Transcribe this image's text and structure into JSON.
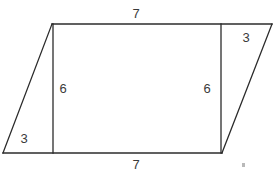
{
  "figure": {
    "stroke_color": "#2b2b2b",
    "label_color": "#3a3a3a",
    "background_color": "#ffffff",
    "stroke_width": 1.3,
    "vertices": {
      "top_left": [
        52,
        24
      ],
      "top_right": [
        272,
        24
      ],
      "bottom_right": [
        222,
        153
      ],
      "bottom_left": [
        3,
        153
      ]
    },
    "interior_segments": {
      "left_vertical": {
        "x": 53,
        "y_top": 24,
        "y_bottom": 153
      },
      "right_vertical": {
        "x": 221,
        "y_top": 24,
        "y_bottom": 153
      }
    },
    "labels": {
      "top_side": "7",
      "bottom_side": "7",
      "left_height": "6",
      "right_height": "6",
      "left_triangle_base": "3",
      "right_triangle_base": "3"
    }
  }
}
